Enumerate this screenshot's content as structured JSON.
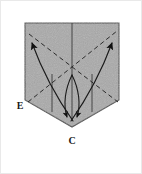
{
  "figure": {
    "name": "origami-fold-diagram",
    "background_color": "#ffffff",
    "border_color": "#e9e9e9",
    "paper": {
      "fill_color": "#a9a9a9",
      "edge_color": "#4a4a4a",
      "shape": "pentagon-rectangle-with-point-bottom",
      "vertices": "24,22 118,22 118,99 71,126 24,99"
    },
    "labels": [
      {
        "id": "E",
        "text": "E",
        "x": 19,
        "y": 108
      },
      {
        "id": "C",
        "text": "C",
        "x": 71,
        "y": 143
      }
    ],
    "crease_lines": {
      "style": "dashed",
      "color": "#2b2b2b",
      "center_point": "71,73"
    },
    "vertical_lines": {
      "style": "solid",
      "color": "#3a3a3a",
      "x_positions": [
        51,
        71,
        91
      ]
    },
    "arrows": [
      {
        "id": "arrow-to-top-left",
        "from": "71,120",
        "to": "30,40",
        "direction": "up-left"
      },
      {
        "id": "arrow-to-top-right",
        "from": "71,120",
        "to": "112,40",
        "direction": "up-right"
      },
      {
        "id": "arrow-to-c-left",
        "from": "71,73",
        "to": "66,121",
        "direction": "down"
      },
      {
        "id": "arrow-to-c-right",
        "from": "71,73",
        "to": "77,121",
        "direction": "down"
      }
    ]
  }
}
